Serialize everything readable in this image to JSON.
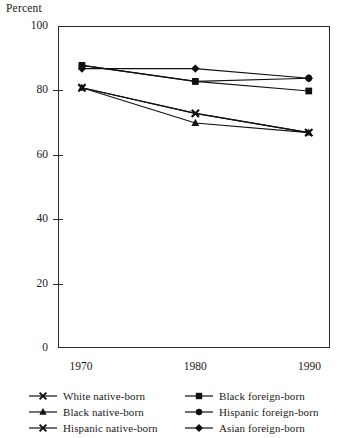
{
  "chart_data": {
    "type": "line",
    "title": "",
    "xlabel": "",
    "ylabel": "Percent",
    "x": [
      1970,
      1980,
      1990
    ],
    "xticklabels": [
      "1970",
      "1980",
      "1990"
    ],
    "ylim": [
      0,
      100
    ],
    "yticks": [
      0,
      20,
      40,
      60,
      80,
      100
    ],
    "yticklabels": [
      "0",
      "20",
      "40",
      "60",
      "80",
      "100"
    ],
    "grid": false,
    "legend_position": "below-axes-two-columns",
    "series": [
      {
        "name": "White native-born",
        "marker": "x",
        "values": [
          81,
          73,
          67
        ]
      },
      {
        "name": "Black native-born",
        "marker": "triangle",
        "values": [
          81,
          70,
          67
        ]
      },
      {
        "name": "Hispanic native-born",
        "marker": "x",
        "values": [
          81,
          73,
          67
        ]
      },
      {
        "name": "Black foreign-born",
        "marker": "square",
        "values": [
          88,
          83,
          80
        ]
      },
      {
        "name": "Hispanic foreign-born",
        "marker": "circle",
        "values": [
          88,
          83,
          84
        ]
      },
      {
        "name": "Asian foreign-born",
        "marker": "diamond",
        "values": [
          87,
          87,
          84
        ]
      }
    ]
  },
  "legend": {
    "entries": [
      {
        "label": "White native-born",
        "marker": "x"
      },
      {
        "label": "Black foreign-born",
        "marker": "square"
      },
      {
        "label": "Black native-born",
        "marker": "triangle"
      },
      {
        "label": "Hispanic foreign-born",
        "marker": "circle"
      },
      {
        "label": "Hispanic native-born",
        "marker": "x"
      },
      {
        "label": "Asian foreign-born",
        "marker": "diamond"
      }
    ]
  },
  "colors": {
    "axis": "#2b2b2b",
    "series": "#111111",
    "background": "#ffffff"
  }
}
